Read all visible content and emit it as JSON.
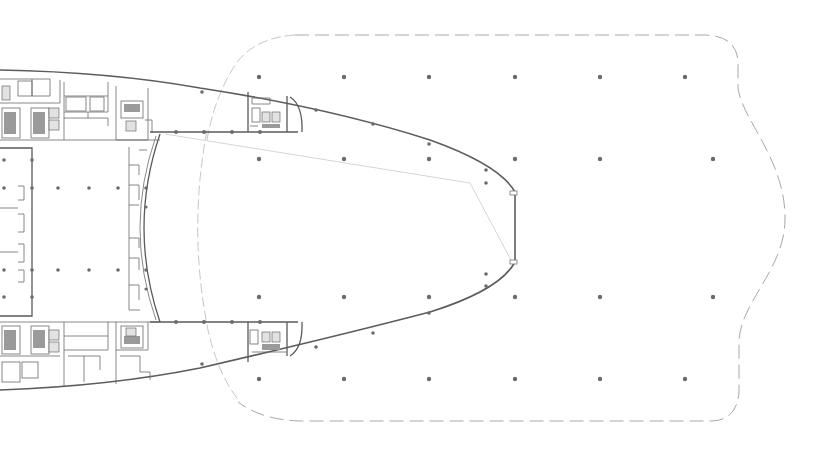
{
  "drawing": {
    "type": "architectural-floor-plan",
    "background": "#ffffff",
    "line_color": "#5a5a5a",
    "column_color": "#6b6b6b",
    "boundary_color": "#a8a8a8",
    "labels": []
  },
  "grid": {
    "top_row_y": 77,
    "upper_row_y": 159,
    "lower_row_y": 297,
    "bottom_row_y": 379,
    "x": [
      259,
      344,
      429,
      515,
      600,
      685
    ]
  },
  "cores": [
    {
      "name": "upper-right-core",
      "x": 248,
      "y": 92
    },
    {
      "name": "lower-right-core",
      "x": 248,
      "y": 324
    },
    {
      "name": "upper-left-core",
      "x": 0,
      "y": 70
    },
    {
      "name": "lower-left-core",
      "x": 0,
      "y": 322
    }
  ]
}
